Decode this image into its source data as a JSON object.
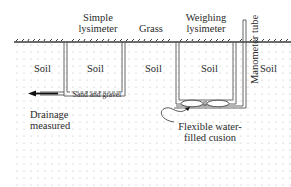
{
  "diagram": {
    "title_labels": {
      "simple_lysimeter_line1": "Simple",
      "simple_lysimeter_line2": "lysimeter",
      "grass": "Grass",
      "weighing_lysimeter_line1": "Weighing",
      "weighing_lysimeter_line2": "lysimeter",
      "manometer_tube": "Manometer tube"
    },
    "soil_labels": [
      "Soil",
      "Soil",
      "Soil",
      "Soil",
      "Soil"
    ],
    "annotations": {
      "sand_and_gravel": "Sand and gravel",
      "drainage_line1": "Drainage",
      "drainage_line2": "measured",
      "cushion_line1": "Flexible water-",
      "cushion_line2": "filled cusion"
    },
    "colors": {
      "line": "#555555",
      "grass": "#3a3a3a",
      "dots": "#b8b8b8",
      "background": "#ffffff"
    }
  }
}
